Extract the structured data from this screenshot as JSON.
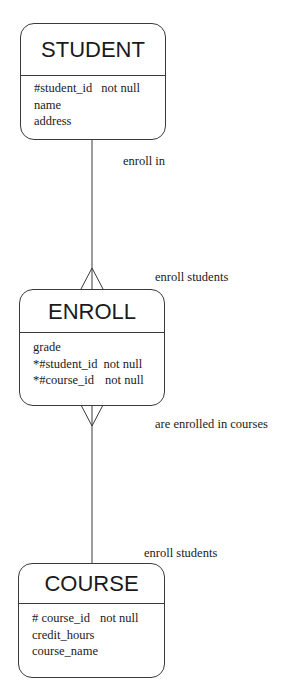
{
  "diagram": {
    "type": "entity-relationship",
    "entities": [
      {
        "id": "student",
        "title": "STUDENT",
        "attributes": [
          {
            "name": "#student_id",
            "constraint": "not null"
          },
          {
            "name": "name",
            "constraint": ""
          },
          {
            "name": "address",
            "constraint": ""
          }
        ]
      },
      {
        "id": "enroll",
        "title": "ENROLL",
        "attributes": [
          {
            "name": "grade",
            "constraint": ""
          },
          {
            "name": "*#student_id",
            "constraint": "not null"
          },
          {
            "name": "*#course_id",
            "constraint": "not null"
          }
        ]
      },
      {
        "id": "course",
        "title": "COURSE",
        "attributes": [
          {
            "name": "# course_id",
            "constraint": "not null"
          },
          {
            "name": "credit_hours",
            "constraint": ""
          },
          {
            "name": "course_name",
            "constraint": ""
          }
        ]
      }
    ],
    "relationships": [
      {
        "from": "student",
        "to": "enroll",
        "from_label": "enroll in",
        "to_label": "enroll students",
        "from_cardinality": "one",
        "to_cardinality": "many"
      },
      {
        "from": "enroll",
        "to": "course",
        "from_label": "are enrolled in courses",
        "to_label": "enroll students",
        "from_cardinality": "many",
        "to_cardinality": "one"
      }
    ],
    "colors": {
      "line": "#3a3a3a",
      "text": "#1a1a1a",
      "background": "#ffffff"
    }
  }
}
